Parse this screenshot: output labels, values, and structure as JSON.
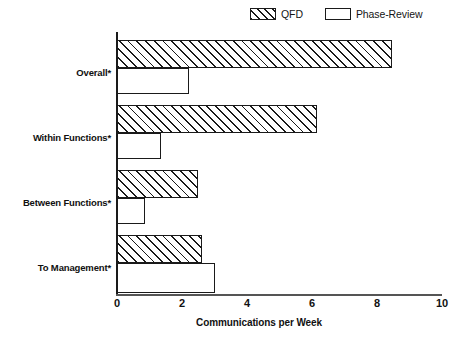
{
  "chart_data": {
    "type": "bar",
    "orientation": "horizontal",
    "title": "",
    "xlabel": "Communications per Week",
    "ylabel": "",
    "categories": [
      "Overall*",
      "Within Functions*",
      "Between Functions*",
      "To Management*"
    ],
    "series": [
      {
        "name": "QFD",
        "values": [
          8.45,
          6.15,
          2.5,
          2.6
        ],
        "fill": "diagonal-hatch",
        "color": "#1a1a1a"
      },
      {
        "name": "Phase-Review",
        "values": [
          2.2,
          1.35,
          0.85,
          3.0
        ],
        "fill": "none",
        "color": "#1a1a1a"
      }
    ],
    "xlim": [
      0,
      10
    ],
    "xticks": [
      0,
      2,
      4,
      6,
      8,
      10
    ],
    "xticklabels": [
      "0",
      "2",
      "4",
      "6",
      "8",
      "10"
    ],
    "grid": false,
    "legend_position": "top-right",
    "legend": [
      {
        "label": "QFD",
        "swatch": "hatched"
      },
      {
        "label": "Phase-Review",
        "swatch": "empty"
      }
    ]
  }
}
